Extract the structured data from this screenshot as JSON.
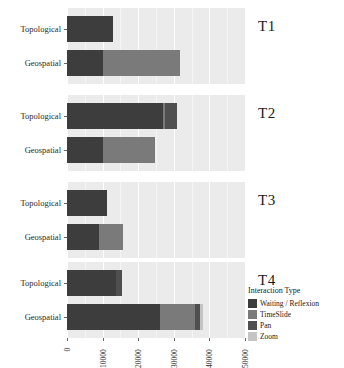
{
  "chart_data": {
    "type": "bar",
    "orientation": "horizontal",
    "stacked": true,
    "title": "",
    "xlabel": "",
    "ylabel": "",
    "xlim": [
      0,
      50000
    ],
    "xticks": [
      0,
      10000,
      20000,
      30000,
      40000,
      50000
    ],
    "xticklabels": [
      "0",
      "10000",
      "20000",
      "30000",
      "40000",
      "50000"
    ],
    "grid": true,
    "grid_axis": "x",
    "legend_title": "Interaction Type",
    "legend_position": "right-bottom",
    "series": [
      {
        "name": "Waiting / Reflexion",
        "color": "#3d3d3d"
      },
      {
        "name": "TimeSlide",
        "color": "#7a7a7a"
      },
      {
        "name": "Pan",
        "color": "#4f4f4f"
      },
      {
        "name": "Zoom",
        "color": "#c4c4c4"
      }
    ],
    "categories": [
      "Topological",
      "Geospatial"
    ],
    "facets": [
      {
        "label": "T1",
        "rows": [
          {
            "category": "Topological",
            "values": [
              12900,
              0,
              0,
              0
            ],
            "total": 12900
          },
          {
            "category": "Geospatial",
            "values": [
              10100,
              21600,
              0,
              0
            ],
            "total": 31700
          }
        ]
      },
      {
        "label": "T2",
        "rows": [
          {
            "category": "Topological",
            "values": [
              27000,
              600,
              3300,
              0
            ],
            "total": 30900
          },
          {
            "category": "Geospatial",
            "values": [
              10100,
              14600,
              0,
              0
            ],
            "total": 24700
          }
        ]
      },
      {
        "label": "T3",
        "rows": [
          {
            "category": "Topological",
            "values": [
              11200,
              0,
              0,
              0
            ],
            "total": 11200
          },
          {
            "category": "Geospatial",
            "values": [
              9000,
              6700,
              0,
              0
            ],
            "total": 15700
          }
        ]
      },
      {
        "label": "T4",
        "rows": [
          {
            "category": "Topological",
            "values": [
              13800,
              0,
              1700,
              0
            ],
            "total": 15500
          },
          {
            "category": "Geospatial",
            "values": [
              26100,
              9800,
              1400,
              800
            ],
            "total": 38100
          }
        ]
      }
    ]
  }
}
